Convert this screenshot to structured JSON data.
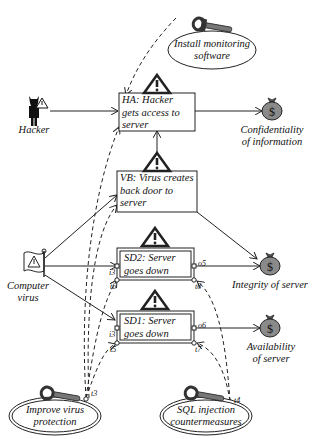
{
  "diagram": {
    "type": "risk-treatment-diagram",
    "threats": {
      "hacker": "Hacker",
      "virus": "Computer virus"
    },
    "threat_lines": {
      "virus_1": "Computer",
      "virus_2": "virus"
    },
    "treatments": {
      "monitoring_1": "Install monitoring",
      "monitoring_2": "software",
      "virus_protection_1": "Improve virus",
      "virus_protection_2": "protection",
      "sql_1": "SQL injection",
      "sql_2": "countermeasures"
    },
    "incidents": {
      "ha_1": "HA: Hacker",
      "ha_2": "gets access to",
      "ha_3": "server",
      "vb_1": "VB: Virus creates",
      "vb_2": "back door to",
      "vb_3": "server",
      "sd2_1": "SD2: Server",
      "sd2_2": "goes down",
      "sd1_1": "SD1: Server",
      "sd1_2": "goes down"
    },
    "assets": {
      "conf_1": "Confidentiality",
      "conf_2": "of information",
      "integrity": "Integrity of server",
      "avail_1": "Availability",
      "avail_2": "of server"
    },
    "ports": {
      "i3_sd2": "i3",
      "t6": "t6",
      "o5": "o5",
      "t8": "t8",
      "i3_sd1": "i3",
      "t5": "t5",
      "o6": "o6",
      "t7": "t7",
      "t3": "t3",
      "t4": "t4"
    },
    "colors": {
      "line": "#222222",
      "asset_fill": "#8a8a8a",
      "box_fill": "#ffffff"
    }
  }
}
